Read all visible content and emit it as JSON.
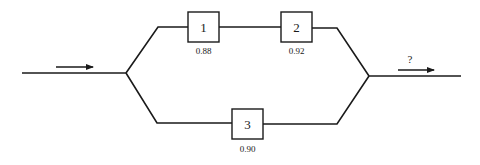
{
  "diagram": {
    "type": "reliability-block-diagram",
    "input_arrow": {
      "direction": "right"
    },
    "output_arrow": {
      "direction": "right",
      "label": "?"
    },
    "components": [
      {
        "id": "1",
        "label": "1",
        "reliability": "0.88",
        "branch": "upper"
      },
      {
        "id": "2",
        "label": "2",
        "reliability": "0.92",
        "branch": "upper"
      },
      {
        "id": "3",
        "label": "3",
        "reliability": "0.90",
        "branch": "lower"
      }
    ]
  }
}
